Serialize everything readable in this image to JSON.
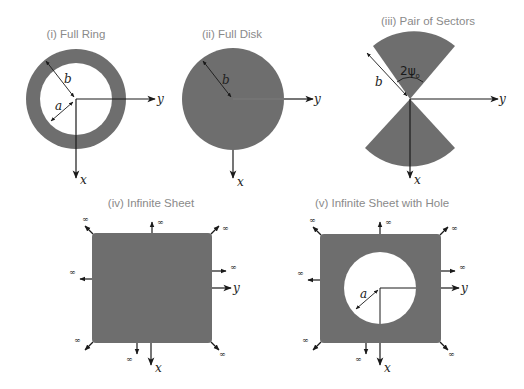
{
  "colors": {
    "fill": "#6e6e6e",
    "stroke": "#1a1a1a",
    "title": "#8a8a8a",
    "background": "#ffffff"
  },
  "panels": [
    {
      "id": "i",
      "title": "(i) Full Ring",
      "labels": {
        "outer_radius": "b",
        "inner_radius": "a",
        "x_axis": "x",
        "y_axis": "y"
      }
    },
    {
      "id": "ii",
      "title": "(ii) Full Disk",
      "labels": {
        "radius": "b",
        "x_axis": "x",
        "y_axis": "y"
      }
    },
    {
      "id": "iii",
      "title": "(iii) Pair of Sectors",
      "labels": {
        "radius": "b",
        "angle": "2ψ",
        "angle_subscript": "o",
        "x_axis": "x",
        "y_axis": "y"
      }
    },
    {
      "id": "iv",
      "title": "(iv) Infinite Sheet",
      "labels": {
        "infinity": "∞",
        "x_axis": "x",
        "y_axis": "y"
      }
    },
    {
      "id": "v",
      "title": "(v) Infinite Sheet with Hole",
      "labels": {
        "hole_radius": "a",
        "infinity": "∞",
        "x_axis": "x",
        "y_axis": "y"
      }
    }
  ]
}
